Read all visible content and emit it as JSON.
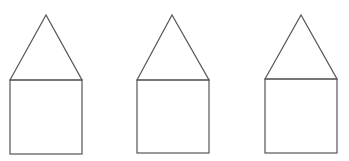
{
  "canvas": {
    "width": 349,
    "height": 161,
    "background": "#ffffff"
  },
  "stroke": {
    "color": "#555555",
    "width": 1.2
  },
  "houses": [
    {
      "roof": {
        "apex": [
          46,
          15
        ],
        "left": [
          10,
          80
        ],
        "right": [
          82,
          80
        ]
      },
      "body": {
        "x": 10,
        "y": 80,
        "width": 72,
        "height": 74
      }
    },
    {
      "roof": {
        "apex": [
          172,
          15
        ],
        "left": [
          137,
          80
        ],
        "right": [
          209,
          80
        ]
      },
      "body": {
        "x": 137,
        "y": 80,
        "width": 72,
        "height": 73
      }
    },
    {
      "roof": {
        "apex": [
          301,
          15
        ],
        "left": [
          265,
          79
        ],
        "right": [
          337,
          79
        ]
      },
      "body": {
        "x": 265,
        "y": 79,
        "width": 72,
        "height": 74
      }
    }
  ]
}
